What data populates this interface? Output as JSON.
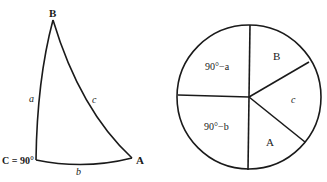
{
  "triangle": {
    "title": "Right spherical triangle",
    "vertices": {
      "B": "B",
      "C": "C = 90°",
      "A": "A"
    },
    "sides": {
      "a": "a",
      "b": "b",
      "c": "c"
    }
  },
  "napier_circle": {
    "title": "Napier's circle",
    "parts": {
      "top_left": "90°−a",
      "bottom_left": "90°−b",
      "top_right": "B",
      "right": "c",
      "bottom_right": "A"
    }
  },
  "colors": {
    "stroke": "#1a1a1a",
    "background": "#ffffff"
  }
}
